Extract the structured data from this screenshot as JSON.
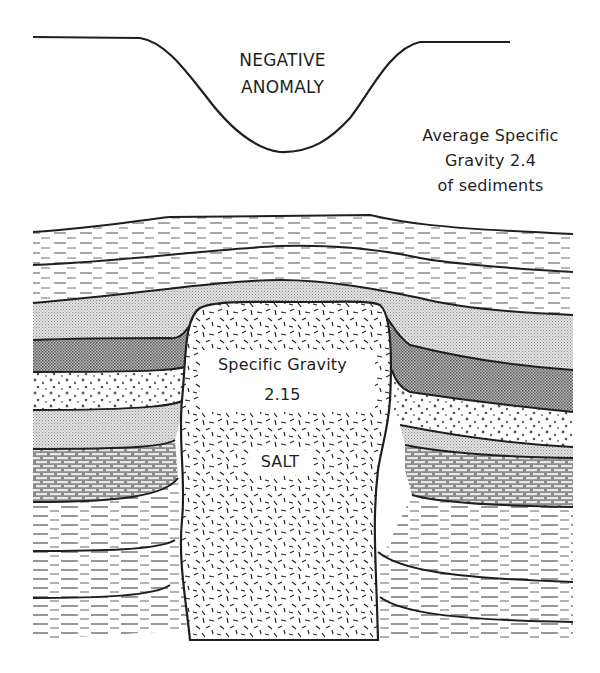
{
  "diagram": {
    "anomaly_profile": {
      "label_line1": "NEGATIVE",
      "label_line2": "ANOMALY"
    },
    "sediments": {
      "label_line1": "Average Specific",
      "label_line2": "Gravity 2.4",
      "label_line3": "of sediments",
      "specific_gravity": 2.4
    },
    "salt_dome": {
      "sg_label": "Specific Gravity",
      "sg_value": "2.15",
      "name": "SALT",
      "specific_gravity": 2.15
    },
    "layers": [
      {
        "name": "upper-shale-1",
        "pattern": "dashes"
      },
      {
        "name": "upper-shale-2",
        "pattern": "dashes"
      },
      {
        "name": "fine-sand",
        "pattern": "fine-stipple"
      },
      {
        "name": "silt",
        "pattern": "dense-stipple"
      },
      {
        "name": "sandstone",
        "pattern": "dots"
      },
      {
        "name": "fine-sand-2",
        "pattern": "fine-stipple"
      },
      {
        "name": "limestone",
        "pattern": "brick"
      },
      {
        "name": "lower-shale",
        "pattern": "dashes"
      }
    ],
    "colors": {
      "ink": "#1f1f1f",
      "paper": "#ffffff",
      "stipple": "#bdbdbd"
    }
  }
}
